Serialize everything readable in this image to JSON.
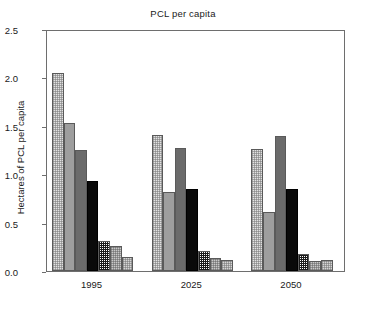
{
  "chart_data": {
    "type": "bar",
    "title": "PCL per capita",
    "xlabel": "",
    "ylabel": "Hectares of PCL per capita",
    "categories": [
      "1995",
      "2025",
      "2050"
    ],
    "ylim": [
      0.0,
      2.5
    ],
    "ytick_labels": [
      "0.0",
      "0.5",
      "1.0",
      "1.5",
      "2.0",
      "2.5"
    ],
    "ytick_values": [
      0.0,
      0.5,
      1.0,
      1.5,
      2.0,
      2.5
    ],
    "grid": false,
    "legend": "none",
    "series": [
      {
        "name": "series-1",
        "fill": "light-checker",
        "values": [
          2.05,
          1.41,
          1.26
        ]
      },
      {
        "name": "series-2",
        "fill": "medium-gray",
        "values": [
          1.53,
          0.82,
          0.61
        ]
      },
      {
        "name": "series-3",
        "fill": "dark-gray",
        "values": [
          1.25,
          1.27,
          1.39
        ]
      },
      {
        "name": "series-4",
        "fill": "black",
        "values": [
          0.93,
          0.85,
          0.85
        ]
      },
      {
        "name": "series-5",
        "fill": "dense-checker",
        "values": [
          0.31,
          0.21,
          0.18
        ]
      },
      {
        "name": "series-6",
        "fill": "gray-checker",
        "values": [
          0.26,
          0.13,
          0.1
        ]
      },
      {
        "name": "series-7",
        "fill": "pale-checker",
        "values": [
          0.14,
          0.11,
          0.11
        ]
      }
    ]
  },
  "axis": {
    "frame_color": "#6e6e6e",
    "text_color": "#1a1a1a"
  }
}
